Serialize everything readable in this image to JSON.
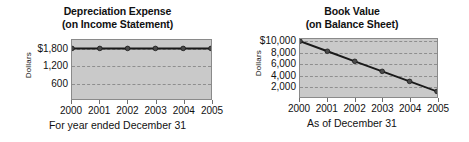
{
  "chart_data": [
    {
      "id": "depreciation",
      "type": "line",
      "title_line1": "Depreciation Expense",
      "title_line2": "(on Income Statement)",
      "ylabel": "Dollars",
      "xlabel": "For year ended December 31",
      "categories": [
        "2000",
        "2001",
        "2002",
        "2003",
        "2004",
        "2005"
      ],
      "values": [
        1800,
        1800,
        1800,
        1800,
        1800,
        1800
      ],
      "yticks": [
        "$1,800",
        "1,200",
        "600"
      ],
      "ytick_values": [
        1800,
        1200,
        600
      ],
      "ylim": [
        0,
        2100
      ],
      "xlim": [
        "2000",
        "2005"
      ],
      "grid": true,
      "legend": "none",
      "series_color": "#1a1a1a",
      "plot_bg": "#c9c9c9",
      "grid_color": "#8e8e8e"
    },
    {
      "id": "bookvalue",
      "type": "line",
      "title_line1": "Book Value",
      "title_line2": "(on Balance Sheet)",
      "ylabel": "Dollars",
      "xlabel": "As of December 31",
      "categories": [
        "2000",
        "2001",
        "2002",
        "2003",
        "2004",
        "2005"
      ],
      "values": [
        10000,
        8200,
        6400,
        4600,
        2800,
        1000
      ],
      "yticks": [
        "$10,000",
        "8,000",
        "6,000",
        "4,000",
        "2,000"
      ],
      "ytick_values": [
        10000,
        8000,
        6000,
        4000,
        2000
      ],
      "ylim": [
        0,
        10400
      ],
      "xlim": [
        "2000",
        "2005"
      ],
      "grid": true,
      "legend": "none",
      "series_color": "#1a1a1a",
      "plot_bg": "#c9c9c9",
      "grid_color": "#8e8e8e"
    }
  ]
}
